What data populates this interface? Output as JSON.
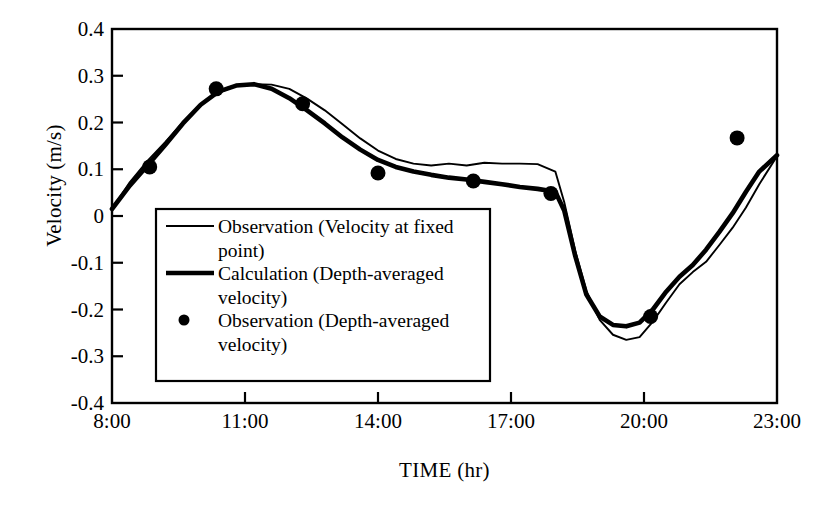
{
  "chart_data": {
    "type": "line",
    "title": "",
    "xlabel": "TIME (hr)",
    "ylabel": "Velocity (m/s)",
    "xlim": [
      8,
      23
    ],
    "ylim": [
      -0.4,
      0.4
    ],
    "grid": false,
    "legend_position": "center-left-inside",
    "x_ticks": [
      "8:00",
      "11:00",
      "14:00",
      "17:00",
      "20:00",
      "23:00"
    ],
    "x_tick_values": [
      8,
      11,
      14,
      17,
      20,
      23
    ],
    "y_ticks": [
      "0.4",
      "0.3",
      "0.2",
      "0.1",
      "0",
      "-0.1",
      "-0.2",
      "-0.3",
      "-0.4"
    ],
    "y_tick_values": [
      0.4,
      0.3,
      0.2,
      0.1,
      0,
      -0.1,
      -0.2,
      -0.3,
      -0.4
    ],
    "series": [
      {
        "name": "Observation (Velocity at fixed point)",
        "style": "thin-line",
        "color": "#000000",
        "x": [
          8.0,
          8.4,
          8.8,
          9.2,
          9.6,
          10.0,
          10.4,
          10.8,
          11.2,
          11.6,
          12.0,
          12.4,
          12.8,
          13.2,
          13.6,
          14.0,
          14.4,
          14.8,
          15.2,
          15.6,
          16.0,
          16.4,
          16.8,
          17.2,
          17.6,
          18.0,
          18.2,
          18.45,
          18.7,
          19.0,
          19.3,
          19.6,
          19.9,
          20.2,
          20.5,
          20.8,
          21.1,
          21.4,
          21.7,
          22.0,
          22.3,
          22.6,
          23.0
        ],
        "y": [
          0.015,
          0.072,
          0.118,
          0.158,
          0.201,
          0.238,
          0.264,
          0.278,
          0.282,
          0.281,
          0.272,
          0.251,
          0.226,
          0.196,
          0.166,
          0.14,
          0.122,
          0.112,
          0.108,
          0.112,
          0.108,
          0.114,
          0.112,
          0.112,
          0.111,
          0.095,
          0.03,
          -0.075,
          -0.16,
          -0.222,
          -0.254,
          -0.265,
          -0.259,
          -0.226,
          -0.185,
          -0.146,
          -0.12,
          -0.098,
          -0.062,
          -0.025,
          0.018,
          0.068,
          0.128
        ]
      },
      {
        "name": "Calculation (Depth-averaged velocity)",
        "style": "thick-line",
        "color": "#000000",
        "x": [
          8.0,
          8.4,
          8.8,
          9.2,
          9.6,
          10.0,
          10.4,
          10.8,
          11.2,
          11.6,
          12.0,
          12.4,
          12.8,
          13.2,
          13.6,
          14.0,
          14.4,
          14.8,
          15.2,
          15.6,
          16.0,
          16.4,
          16.8,
          17.2,
          17.6,
          18.0,
          18.2,
          18.45,
          18.7,
          19.0,
          19.3,
          19.6,
          19.9,
          20.2,
          20.5,
          20.8,
          21.1,
          21.4,
          21.7,
          22.0,
          22.3,
          22.6,
          23.0
        ],
        "y": [
          0.015,
          0.065,
          0.108,
          0.152,
          0.198,
          0.238,
          0.266,
          0.279,
          0.282,
          0.272,
          0.252,
          0.226,
          0.198,
          0.168,
          0.142,
          0.12,
          0.105,
          0.095,
          0.088,
          0.082,
          0.078,
          0.073,
          0.068,
          0.062,
          0.058,
          0.052,
          0.012,
          -0.086,
          -0.168,
          -0.215,
          -0.233,
          -0.236,
          -0.228,
          -0.2,
          -0.162,
          -0.13,
          -0.105,
          -0.072,
          -0.034,
          0.006,
          0.052,
          0.095,
          0.13
        ]
      },
      {
        "name": "Observation (Depth-averaged velocity)",
        "style": "marker",
        "color": "#000000",
        "x": [
          8.85,
          10.35,
          12.3,
          14.0,
          16.15,
          17.9,
          20.15,
          22.1
        ],
        "y": [
          0.105,
          0.272,
          0.24,
          0.092,
          0.075,
          0.048,
          -0.215,
          0.167
        ]
      }
    ]
  },
  "legend": {
    "items": [
      {
        "label": "Observation (Velocity at fixed point)",
        "marker": "thin-line"
      },
      {
        "label": "Calculation (Depth-averaged velocity)",
        "marker": "thick-line"
      },
      {
        "label": "Observation (Depth-averaged velocity)",
        "marker": "dot"
      }
    ]
  },
  "caption": ""
}
